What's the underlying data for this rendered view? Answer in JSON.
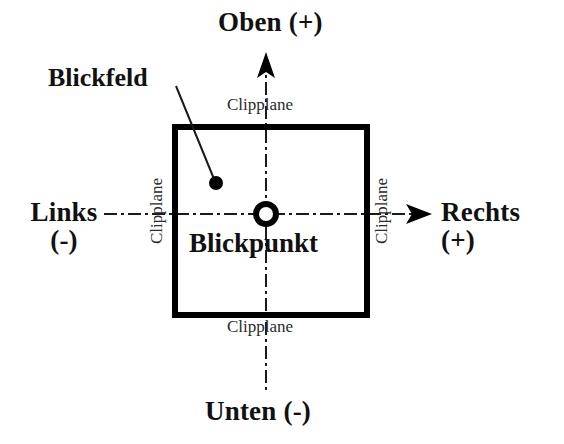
{
  "diagram": {
    "background_color": "#ffffff",
    "stroke_color": "#000000",
    "axes": {
      "up": {
        "label": "Oben",
        "sign": "(+)",
        "arrow": "arrow-up-icon"
      },
      "down": {
        "label": "Unten (-)",
        "arrow": "none"
      },
      "left": {
        "label": "Links",
        "sign": "(-)",
        "arrow": "none"
      },
      "right": {
        "label": "Rechts",
        "sign": "(+)",
        "arrow": "arrow-right-icon"
      }
    },
    "viewport": {
      "name": "Blickfeld",
      "callout_label": "Blickfeld",
      "border_width_px": 6,
      "rect": {
        "x": 172,
        "y": 124,
        "width": 198,
        "height": 194
      }
    },
    "focus_point": {
      "label": "Blickpunkt",
      "marker": "ring-icon",
      "center": {
        "x": 266,
        "y": 214
      },
      "outer_radius": 13,
      "inner_radius": 7
    },
    "sample_point": {
      "marker": "filled-dot-icon",
      "center": {
        "x": 216,
        "y": 183
      },
      "radius": 7
    },
    "clipplanes": [
      {
        "position": "top",
        "label": "Clipplane"
      },
      {
        "position": "right",
        "label": "Clipplane"
      },
      {
        "position": "bottom",
        "label": "Clipplane"
      },
      {
        "position": "left",
        "label": "Clipplane"
      }
    ],
    "guide_lines": {
      "style": "dash-dot",
      "horizontal_y": 214,
      "vertical_x": 266
    }
  }
}
